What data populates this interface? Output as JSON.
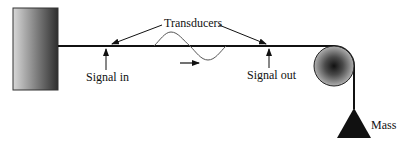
{
  "diagram": {
    "type": "wire-wave-apparatus",
    "labels": {
      "transducers": "Transducers",
      "signal_in": "Signal in",
      "signal_out": "Signal out",
      "mass": "Mass"
    },
    "components": [
      {
        "name": "wall-support",
        "shape": "gradient-rectangle"
      },
      {
        "name": "wire",
        "shape": "horizontal-line"
      },
      {
        "name": "transverse-wave",
        "shape": "sine-pulse"
      },
      {
        "name": "propagation-direction",
        "shape": "right-arrow"
      },
      {
        "name": "pulley",
        "shape": "shaded-circle"
      },
      {
        "name": "hanging-mass",
        "shape": "triangle"
      }
    ],
    "colors": {
      "line": "#111111",
      "wave": "#555555",
      "wall_light": "#d8d8d8",
      "wall_dark": "#333333",
      "pulley_center": "#111111",
      "pulley_edge": "#a8a8a8"
    }
  }
}
